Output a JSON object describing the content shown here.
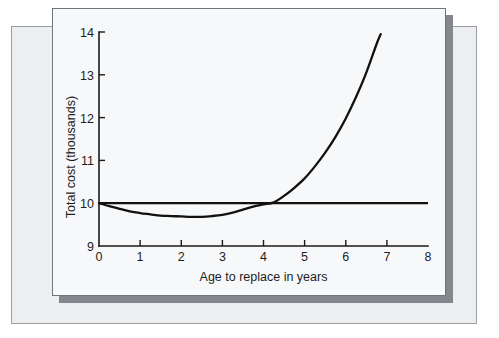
{
  "figure": {
    "background_color": "#ffffff",
    "outer_panel_color": "#eceef0",
    "card_color": "#f7f8f9",
    "shadow_color": "#84878c",
    "ink_color": "#111111"
  },
  "chart_data": {
    "type": "line",
    "title": "",
    "subtitle": "",
    "xlabel": "Age to replace in years",
    "ylabel": "Total cost (thousands)",
    "xlim": [
      0,
      8
    ],
    "ylim": [
      9,
      14
    ],
    "xticks": [
      0,
      1,
      2,
      3,
      4,
      5,
      6,
      7,
      8
    ],
    "xtick_labels": [
      "0",
      "1",
      "2",
      "3",
      "4",
      "5",
      "6",
      "7",
      "8"
    ],
    "yticks": [
      9,
      10,
      11,
      12,
      13,
      14
    ],
    "ytick_labels": [
      "9",
      "10",
      "11",
      "12",
      "13",
      "14"
    ],
    "grid": false,
    "legend": null,
    "legend_position": "none",
    "annotations": [],
    "series": [
      {
        "name": "Total cost curve",
        "color": "#111111",
        "x": [
          0.0,
          0.25,
          0.5,
          0.75,
          1.0,
          1.25,
          1.5,
          1.75,
          2.0,
          2.25,
          2.5,
          2.75,
          3.0,
          3.25,
          3.5,
          3.75,
          4.0,
          4.25,
          4.5,
          4.75,
          5.0,
          5.25,
          5.5,
          5.75,
          6.0,
          6.25,
          6.5,
          6.75,
          6.85
        ],
        "y": [
          10.0,
          9.93,
          9.87,
          9.81,
          9.77,
          9.74,
          9.71,
          9.7,
          9.69,
          9.68,
          9.68,
          9.7,
          9.73,
          9.78,
          9.85,
          9.92,
          9.97,
          10.02,
          10.17,
          10.36,
          10.58,
          10.86,
          11.18,
          11.55,
          11.98,
          12.48,
          13.05,
          13.72,
          13.95
        ]
      },
      {
        "name": "Constant cost reference line",
        "color": "#111111",
        "x": [
          0,
          8
        ],
        "y": [
          10,
          10
        ]
      }
    ],
    "key_points": {
      "minimum": {
        "x": 2.4,
        "y": 9.68
      },
      "crossing_with_reference": {
        "x": 4.2,
        "y": 10.0
      },
      "curve_end": {
        "x": 6.85,
        "y": 13.95
      },
      "curve_start": {
        "x": 0.0,
        "y": 10.0
      }
    }
  }
}
